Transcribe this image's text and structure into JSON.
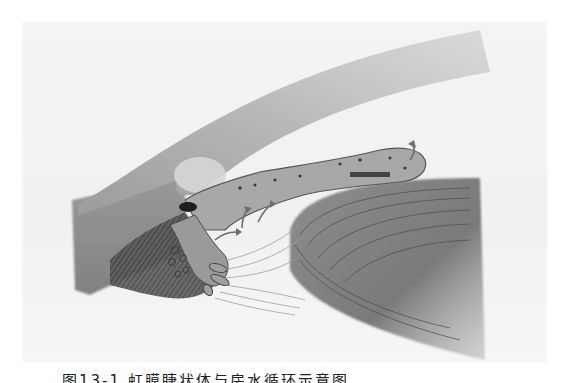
{
  "figure": {
    "regions": [
      {
        "name": "cornea-sclera",
        "description": "curved band from upper right sweeping down-left"
      },
      {
        "name": "iris",
        "description": "horizontal tissue strip with pigment spots ending at pupil margin"
      },
      {
        "name": "ciliary-body",
        "description": "pigmented fibrous mass at lower left with ciliary processes"
      },
      {
        "name": "lens",
        "description": "layered lens segment at lower right"
      },
      {
        "name": "zonular-fibers",
        "description": "thin fibers linking ciliary processes to lens"
      },
      {
        "name": "schlemm-canal",
        "description": "dark opening at the angle"
      },
      {
        "name": "flow-arrows",
        "description": "arrows showing aqueous flow from ciliary body toward pupil",
        "count": 4
      }
    ],
    "colors": {
      "background": "#f3f3f3",
      "tissue_light": "#c9c9c9",
      "tissue_mid": "#9a9a9a",
      "tissue_dark": "#5a5a5a",
      "pigment": "#2e2e2e"
    }
  },
  "caption": {
    "text": "图13-1 虹膜睫状体与房水循环示意图",
    "truncated": true
  }
}
